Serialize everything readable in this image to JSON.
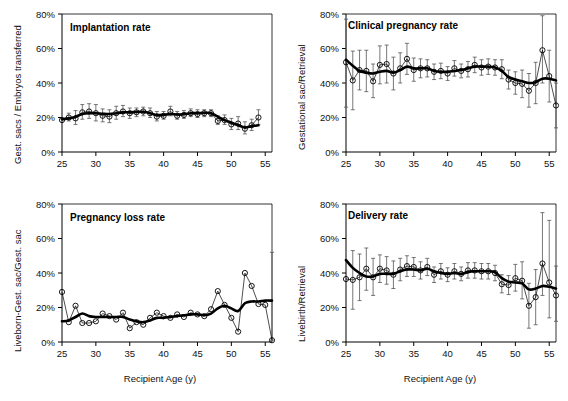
{
  "figure": {
    "xlabel": "Recipient Age (y)",
    "background": "#ffffff",
    "line_color": "#000000",
    "marker_color": "#000000"
  },
  "chart_data": [
    {
      "type": "line",
      "panel": 1,
      "title": "Implantation rate",
      "ylabel": "Gest. sacs / Embryos transferred",
      "xlabel": "",
      "xlim": [
        25,
        56
      ],
      "ylim": [
        0,
        80
      ],
      "xticks": [
        25,
        30,
        35,
        40,
        45,
        50,
        55
      ],
      "yticks": [
        0,
        20,
        40,
        60,
        80
      ],
      "ytick_labels": [
        "0%",
        "20%",
        "40%",
        "60%",
        "80%"
      ],
      "grid": false,
      "legend": "none",
      "x": [
        25,
        26,
        27,
        28,
        29,
        30,
        31,
        32,
        33,
        34,
        35,
        36,
        37,
        38,
        39,
        40,
        41,
        42,
        43,
        44,
        45,
        46,
        47,
        48,
        49,
        50,
        51,
        52,
        53,
        54
      ],
      "series": [
        {
          "name": "Observed implantation rate",
          "values": [
            18.5,
            20.0,
            19.5,
            23.0,
            23.5,
            22.5,
            21.0,
            20.5,
            22.5,
            23.5,
            22.5,
            23.0,
            23.5,
            22.5,
            20.5,
            21.0,
            23.5,
            21.0,
            21.5,
            22.5,
            22.0,
            22.5,
            22.5,
            18.0,
            18.5,
            16.0,
            16.5,
            13.5,
            15.5,
            20.0
          ],
          "err_low": [
            18.5,
            18.0,
            16.0,
            19.0,
            19.5,
            18.0,
            17.5,
            17.0,
            19.0,
            20.5,
            19.5,
            20.5,
            21.0,
            20.0,
            18.0,
            19.0,
            21.0,
            19.0,
            19.5,
            20.5,
            20.0,
            20.5,
            20.5,
            16.0,
            16.0,
            13.0,
            13.0,
            10.5,
            12.5,
            16.0
          ],
          "err_high": [
            18.5,
            22.5,
            24.0,
            27.5,
            28.0,
            27.5,
            25.0,
            24.5,
            26.5,
            27.0,
            25.5,
            25.5,
            26.0,
            25.5,
            23.5,
            23.5,
            26.5,
            23.5,
            24.0,
            25.0,
            24.5,
            24.5,
            24.5,
            21.0,
            21.5,
            19.5,
            20.5,
            17.5,
            19.0,
            24.5
          ]
        },
        {
          "name": "Smoothed trend",
          "values": [
            19.0,
            19.5,
            20.5,
            22.0,
            22.5,
            22.5,
            22.2,
            22.0,
            22.5,
            23.0,
            23.0,
            23.2,
            23.3,
            22.5,
            21.5,
            21.5,
            22.0,
            21.7,
            22.0,
            22.5,
            22.5,
            22.7,
            22.5,
            20.5,
            18.5,
            17.0,
            15.5,
            14.2,
            15.0,
            15.5
          ]
        }
      ]
    },
    {
      "type": "line",
      "panel": 2,
      "title": "Clinical pregnancy rate",
      "ylabel": "Gestational sac/Retrieval",
      "xlabel": "",
      "xlim": [
        25,
        56
      ],
      "ylim": [
        0,
        80
      ],
      "xticks": [
        25,
        30,
        35,
        40,
        45,
        50,
        55
      ],
      "yticks": [
        0,
        20,
        40,
        60,
        80
      ],
      "ytick_labels": [
        "0%",
        "20%",
        "40%",
        "60%",
        "80%"
      ],
      "grid": false,
      "legend": "none",
      "x": [
        25,
        26,
        27,
        28,
        29,
        30,
        31,
        32,
        33,
        34,
        35,
        36,
        37,
        38,
        39,
        40,
        41,
        42,
        43,
        44,
        45,
        46,
        47,
        48,
        49,
        50,
        51,
        52,
        53,
        54,
        55,
        56
      ],
      "series": [
        {
          "name": "Observed clinical pregnancy rate",
          "values": [
            52.0,
            41.5,
            47.5,
            47.0,
            41.0,
            50.5,
            51.0,
            45.5,
            48.5,
            54.0,
            47.5,
            48.5,
            48.5,
            46.5,
            47.0,
            45.5,
            48.5,
            47.0,
            48.0,
            50.5,
            49.0,
            49.5,
            49.0,
            48.0,
            42.0,
            40.0,
            39.5,
            35.5,
            40.0,
            59.0,
            44.0,
            27.0
          ],
          "err_low": [
            26.0,
            24.5,
            36.0,
            35.0,
            31.5,
            39.5,
            40.0,
            36.0,
            40.0,
            45.0,
            41.0,
            43.0,
            43.5,
            42.0,
            42.5,
            41.5,
            44.0,
            43.0,
            43.5,
            46.0,
            44.5,
            45.0,
            44.5,
            42.5,
            36.5,
            33.5,
            31.5,
            26.0,
            28.0,
            40.0,
            29.0,
            14.0
          ],
          "err_high": [
            77.0,
            58.5,
            59.0,
            59.0,
            51.0,
            61.5,
            62.0,
            55.0,
            57.5,
            63.0,
            54.5,
            54.0,
            53.5,
            51.0,
            51.5,
            49.5,
            53.0,
            51.0,
            52.5,
            55.0,
            53.5,
            54.0,
            53.5,
            53.5,
            47.5,
            46.5,
            47.5,
            45.5,
            52.0,
            79.0,
            59.0,
            40.0
          ]
        },
        {
          "name": "Smoothed trend",
          "values": [
            53.5,
            50.0,
            47.0,
            46.0,
            45.5,
            46.5,
            47.0,
            46.0,
            47.5,
            49.5,
            48.5,
            48.5,
            48.5,
            47.0,
            46.5,
            46.5,
            47.0,
            47.5,
            48.5,
            49.5,
            49.5,
            49.5,
            49.0,
            47.0,
            43.5,
            42.0,
            41.0,
            40.0,
            40.5,
            42.5,
            42.5,
            41.5
          ]
        }
      ]
    },
    {
      "type": "line",
      "panel": 3,
      "title": "Pregnancy loss rate",
      "ylabel": "Liveborn-Gest. sac/Gest. sac",
      "xlabel": "Recipient Age (y)",
      "xlim": [
        25,
        56
      ],
      "ylim": [
        0,
        80
      ],
      "xticks": [
        25,
        30,
        35,
        40,
        45,
        50,
        55
      ],
      "yticks": [
        0,
        20,
        40,
        60,
        80
      ],
      "ytick_labels": [
        "0%",
        "20%",
        "40%",
        "60%",
        "80%"
      ],
      "grid": false,
      "legend": "none",
      "x": [
        25,
        26,
        27,
        28,
        29,
        30,
        31,
        32,
        33,
        34,
        35,
        36,
        37,
        38,
        39,
        40,
        41,
        42,
        43,
        44,
        45,
        46,
        47,
        48,
        49,
        50,
        51,
        52,
        53,
        54,
        55,
        56
      ],
      "series": [
        {
          "name": "Observed pregnancy loss rate",
          "values": [
            29.0,
            11.5,
            21.0,
            11.0,
            11.0,
            12.0,
            16.5,
            15.0,
            13.0,
            17.0,
            8.0,
            11.5,
            10.0,
            14.0,
            17.0,
            15.0,
            14.0,
            16.0,
            14.5,
            17.0,
            16.0,
            15.0,
            19.0,
            29.5,
            21.5,
            14.0,
            6.0,
            40.0,
            32.5,
            22.0,
            21.5,
            1.0
          ],
          "err_low": [
            29.0,
            11.5,
            21.0,
            11.0,
            11.0,
            12.0,
            16.5,
            15.0,
            13.0,
            17.0,
            8.0,
            11.5,
            10.0,
            14.0,
            17.0,
            15.0,
            14.0,
            16.0,
            14.5,
            17.0,
            16.0,
            15.0,
            19.0,
            29.5,
            21.5,
            14.0,
            6.0,
            40.0,
            32.5,
            22.0,
            21.5,
            1.0
          ],
          "err_high": [
            29.0,
            11.5,
            21.0,
            11.0,
            11.0,
            12.0,
            16.5,
            15.0,
            13.0,
            17.0,
            8.0,
            11.5,
            10.0,
            14.0,
            17.0,
            15.0,
            14.0,
            16.0,
            14.5,
            17.0,
            16.0,
            15.0,
            19.0,
            29.5,
            21.5,
            14.0,
            6.0,
            40.0,
            32.5,
            22.0,
            21.5,
            52.0
          ]
        },
        {
          "name": "Smoothed trend",
          "values": [
            12.0,
            12.5,
            14.5,
            16.5,
            15.0,
            14.5,
            14.5,
            14.5,
            14.5,
            14.5,
            13.0,
            12.0,
            11.5,
            12.5,
            14.0,
            14.0,
            14.5,
            15.0,
            15.5,
            16.0,
            16.0,
            15.5,
            16.5,
            19.5,
            21.0,
            19.5,
            18.0,
            22.5,
            23.5,
            23.5,
            24.0,
            24.0
          ]
        }
      ]
    },
    {
      "type": "line",
      "panel": 4,
      "title": "Delivery rate",
      "ylabel": "Livebirth/Retrieval",
      "xlabel": "Recipient Age (y)",
      "xlim": [
        25,
        56
      ],
      "ylim": [
        0,
        80
      ],
      "xticks": [
        25,
        30,
        35,
        40,
        45,
        50,
        55
      ],
      "yticks": [
        0,
        20,
        40,
        60,
        80
      ],
      "ytick_labels": [
        "0%",
        "20%",
        "40%",
        "60%",
        "80%"
      ],
      "grid": false,
      "legend": "none",
      "x": [
        25,
        26,
        27,
        28,
        29,
        30,
        31,
        32,
        33,
        34,
        35,
        36,
        37,
        38,
        39,
        40,
        41,
        42,
        43,
        44,
        45,
        46,
        47,
        48,
        49,
        50,
        51,
        52,
        53,
        54,
        55,
        56
      ],
      "series": [
        {
          "name": "Observed delivery rate",
          "values": [
            36.5,
            36.0,
            37.5,
            42.5,
            37.5,
            42.5,
            41.5,
            39.0,
            42.0,
            44.0,
            43.5,
            41.5,
            43.5,
            39.0,
            41.0,
            39.0,
            41.0,
            39.5,
            41.5,
            41.5,
            41.0,
            41.0,
            40.0,
            33.5,
            33.0,
            37.0,
            35.5,
            21.0,
            26.0,
            45.5,
            34.5,
            27.0
          ],
          "err_low": [
            36.5,
            19.0,
            24.0,
            30.0,
            27.0,
            34.5,
            33.5,
            31.0,
            35.5,
            38.0,
            38.0,
            36.5,
            38.5,
            34.5,
            36.5,
            35.0,
            36.5,
            35.5,
            37.0,
            37.0,
            36.5,
            36.5,
            35.5,
            28.5,
            27.5,
            29.5,
            25.0,
            8.0,
            10.0,
            27.0,
            14.0,
            12.0
          ],
          "err_high": [
            36.5,
            53.0,
            51.0,
            54.5,
            48.5,
            50.5,
            49.5,
            47.0,
            48.5,
            50.0,
            49.0,
            46.5,
            48.5,
            43.5,
            45.5,
            43.0,
            45.5,
            43.5,
            46.0,
            46.0,
            45.5,
            45.5,
            44.5,
            39.0,
            38.5,
            45.0,
            46.5,
            34.0,
            42.0,
            75.0,
            70.5,
            44.0
          ]
        },
        {
          "name": "Smoothed trend",
          "values": [
            47.5,
            43.0,
            40.0,
            38.0,
            38.0,
            39.5,
            39.5,
            39.5,
            41.0,
            42.0,
            42.0,
            41.5,
            42.5,
            41.0,
            40.0,
            39.5,
            40.0,
            39.5,
            40.5,
            41.0,
            41.0,
            41.0,
            40.5,
            37.0,
            35.0,
            34.5,
            34.0,
            30.5,
            31.0,
            32.5,
            32.0,
            31.0
          ]
        }
      ]
    }
  ]
}
